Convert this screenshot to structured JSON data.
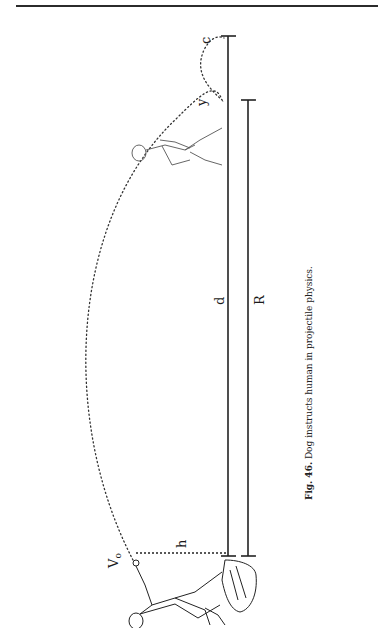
{
  "figure": {
    "labels": {
      "v0": "V",
      "v0_sub": "o",
      "h": "h",
      "d": "d",
      "R": "R",
      "y": "y",
      "c": "c"
    },
    "caption": {
      "prefix": "Fig. 46.",
      "text": " Dog instructs human in projectile physics."
    }
  }
}
